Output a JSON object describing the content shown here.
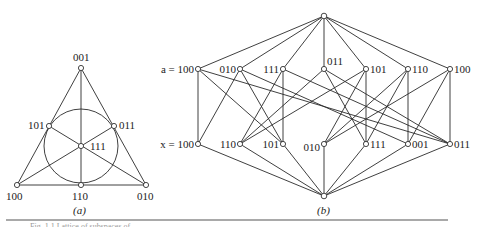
{
  "figure_a": {
    "caption": "(a)",
    "nodes": [
      {
        "id": "001",
        "label": "001",
        "x": 81,
        "y": 68,
        "lx": 73,
        "ly": 61
      },
      {
        "id": "101",
        "label": "101",
        "x": 49,
        "y": 126,
        "lx": 28,
        "ly": 129
      },
      {
        "id": "011",
        "label": "011",
        "x": 114,
        "y": 126,
        "lx": 119,
        "ly": 129
      },
      {
        "id": "111",
        "label": "111",
        "x": 81,
        "y": 146,
        "lx": 90,
        "ly": 150
      },
      {
        "id": "100",
        "label": "100",
        "x": 17,
        "y": 185,
        "lx": 6,
        "ly": 200
      },
      {
        "id": "110",
        "label": "110",
        "x": 81,
        "y": 185,
        "lx": 72,
        "ly": 200
      },
      {
        "id": "010",
        "label": "010",
        "x": 146,
        "y": 185,
        "lx": 137,
        "ly": 200
      }
    ],
    "circle": {
      "cx": 81,
      "cy": 146,
      "r": 37
    },
    "lines": [
      [
        "100",
        "001"
      ],
      [
        "001",
        "010"
      ],
      [
        "100",
        "010"
      ],
      [
        "100",
        "011"
      ],
      [
        "010",
        "101"
      ],
      [
        "001",
        "110"
      ]
    ]
  },
  "figure_b": {
    "caption": "(b)",
    "top": {
      "x": 324,
      "y": 16
    },
    "bottom": {
      "x": 324,
      "y": 196
    },
    "row_top_prefix": "a = 100",
    "row_bottom_prefix": "x = 100",
    "top_row": [
      {
        "label": "a = 100",
        "x": 198
      },
      {
        "label": "010",
        "x": 240
      },
      {
        "label": "111",
        "x": 283
      },
      {
        "label": "011",
        "x": 324
      },
      {
        "label": "101",
        "x": 366
      },
      {
        "label": "110",
        "x": 408
      },
      {
        "label": "100",
        "x": 450
      }
    ],
    "bottom_row": [
      {
        "label": "x = 100",
        "x": 198
      },
      {
        "label": "110",
        "x": 240
      },
      {
        "label": "101",
        "x": 283
      },
      {
        "label": "010",
        "x": 324
      },
      {
        "label": "111",
        "x": 366
      },
      {
        "label": "001",
        "x": 408
      },
      {
        "label": "011",
        "x": 450
      }
    ],
    "top_y": 69,
    "bottom_y": 144,
    "edges": [
      [
        0,
        0
      ],
      [
        0,
        2
      ],
      [
        0,
        6
      ],
      [
        1,
        0
      ],
      [
        1,
        2
      ],
      [
        1,
        5
      ],
      [
        2,
        1
      ],
      [
        2,
        2
      ],
      [
        2,
        6
      ],
      [
        3,
        1
      ],
      [
        3,
        4
      ],
      [
        3,
        6
      ],
      [
        4,
        1
      ],
      [
        4,
        3
      ],
      [
        4,
        4
      ],
      [
        5,
        3
      ],
      [
        5,
        5
      ],
      [
        5,
        4
      ],
      [
        6,
        3
      ],
      [
        6,
        5
      ],
      [
        6,
        6
      ]
    ]
  },
  "footer_text": "Fig. 1.1 Lattice of subspaces of ..."
}
